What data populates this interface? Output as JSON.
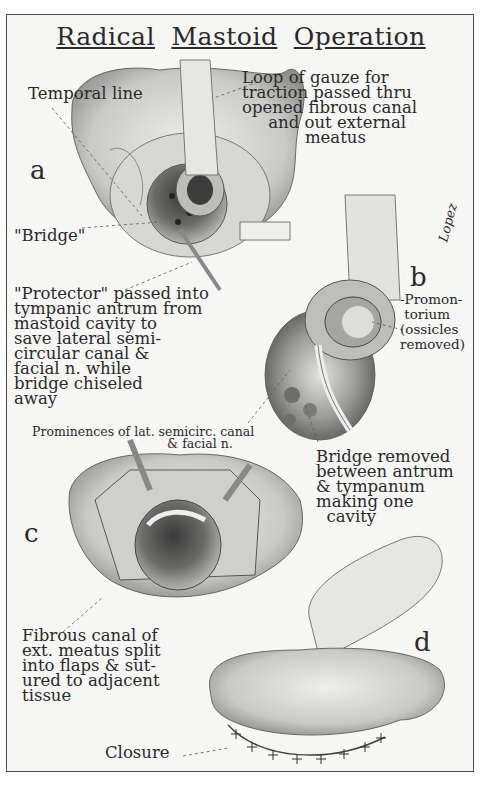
{
  "title": {
    "words": [
      "Radical",
      "Mastoid",
      "Operation"
    ]
  },
  "panels": {
    "a": {
      "letter": "a"
    },
    "b": {
      "letter": "b"
    },
    "c": {
      "letter": "c"
    },
    "d": {
      "letter": "d"
    }
  },
  "labels": {
    "temporal_line": "Temporal line",
    "loop_of_gauze": "Loop of gauze for\ntraction passed thru\nopened fibrous canal\n     and out external\n            meatus",
    "bridge": "\"Bridge\"",
    "protector": "\"Protector\" passed into\ntympanic antrum from\nmastoid cavity to\nsave lateral semi-\ncircular canal &\nfacial n. while\nbridge chiseled\naway",
    "promontorium": "-Promon-\n torium\n(ossicles\nremoved)",
    "prominences": "Prominences of lat. semicirc. canal\n                                  & facial n.",
    "bridge_removed": "Bridge removed\nbetween antrum\n& tympanum\nmaking one\n  cavity",
    "fibrous_canal": "Fibrous canal of\next. meatus split\ninto flaps & sut-\nured to adjacent\ntissue",
    "closure": "Closure"
  },
  "signature": "Lopez"
}
